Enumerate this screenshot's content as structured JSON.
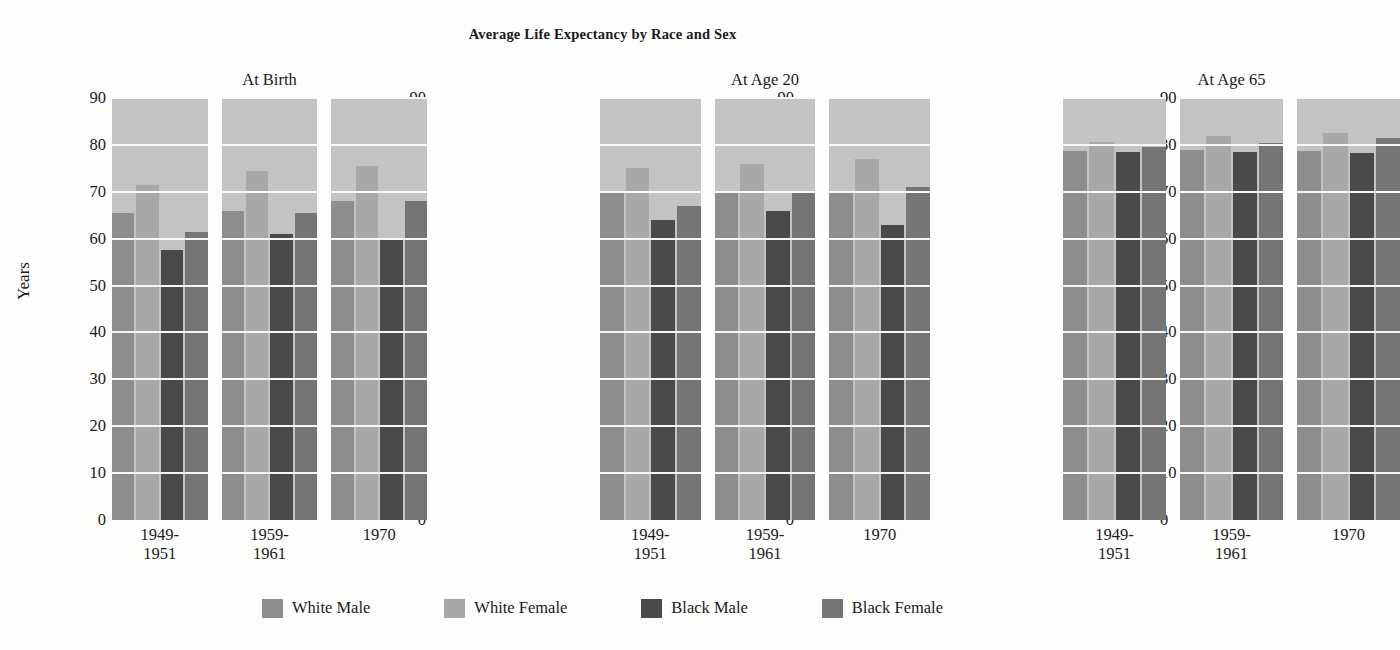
{
  "chart_data": {
    "type": "bar",
    "title": "Average Life Expectancy by Race and Sex",
    "xlabel": "",
    "ylabel": "Years",
    "ylim": [
      0,
      90
    ],
    "ytick_step": 10,
    "yticks": [
      "90",
      "80",
      "70",
      "60",
      "50",
      "40",
      "30",
      "20",
      "10",
      "0"
    ],
    "grid": true,
    "legend_position": "bottom",
    "categories": [
      "1949-\n1951",
      "1959-\n1961",
      "1970"
    ],
    "series": [
      {
        "name": "White Male",
        "color": "#8d8d8d"
      },
      {
        "name": "White Female",
        "color": "#a8a8a8"
      },
      {
        "name": "Black Male",
        "color": "#4a4a4a"
      },
      {
        "name": "Black Female",
        "color": "#757575"
      }
    ],
    "panels": [
      {
        "title": "At  Birth",
        "groups": [
          {
            "label": "1949-\n1951",
            "values": [
              65.5,
              71.5,
              57.5,
              61.5
            ]
          },
          {
            "label": "1959-\n1961",
            "values": [
              66.0,
              74.5,
              61.0,
              65.5
            ]
          },
          {
            "label": "1970",
            "values": [
              68.0,
              75.5,
              60.0,
              68.0
            ]
          }
        ]
      },
      {
        "title": "At Age 20",
        "groups": [
          {
            "label": "1949-\n1951",
            "values": [
              70.0,
              75.0,
              64.0,
              67.0
            ]
          },
          {
            "label": "1959-\n1961",
            "values": [
              70.0,
              76.0,
              66.0,
              70.0
            ]
          },
          {
            "label": "1970",
            "values": [
              70.0,
              77.0,
              63.0,
              71.0
            ]
          }
        ]
      },
      {
        "title": "At Age 65",
        "groups": [
          {
            "label": "1949-\n1951",
            "values": [
              78.7,
              80.6,
              78.4,
              79.5
            ]
          },
          {
            "label": "1959-\n1961",
            "values": [
              79.0,
              81.8,
              78.4,
              80.3
            ]
          },
          {
            "label": "1970",
            "values": [
              78.8,
              82.5,
              78.3,
              81.5
            ]
          }
        ]
      }
    ],
    "plot_background": "#c3c3c3",
    "gridline_color": "#f7f7f4",
    "page_background": "#fdfdfb"
  },
  "layout": {
    "panel_lefts": [
      112,
      600,
      1063
    ],
    "panel_widths": [
      315,
      330,
      337
    ],
    "tick_col_lefts": [
      72,
      392,
      760,
      1160
    ]
  }
}
